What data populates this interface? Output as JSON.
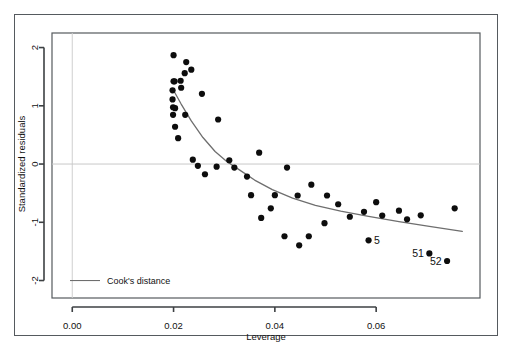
{
  "figure": {
    "kind": "r-base-plot",
    "background_color": "#ffffff",
    "frame_color": "#555a5e",
    "point_color": "#0d0d0d",
    "curve_color": "#6e6e6e",
    "zero_line_color": "#c8c8c8",
    "grid_line_color": "#cfcfcf"
  },
  "chart_data": {
    "type": "scatter",
    "title": "",
    "subtitle": "",
    "xlabel": "Leverage",
    "ylabel": "Standardized residuals",
    "xlim": [
      -0.004,
      0.0805
    ],
    "ylim": [
      -2.3,
      2.25
    ],
    "xticks": [
      0.0,
      0.02,
      0.04,
      0.06
    ],
    "xtick_labels": [
      "0.00",
      "0.02",
      "0.04",
      "0.06"
    ],
    "yticks": [
      2,
      1,
      0,
      -1,
      -2
    ],
    "ytick_labels": [
      "2",
      "1",
      "0",
      "-1",
      "-2"
    ],
    "grid": false,
    "zero_line": 0,
    "vertical_reference_line_x": 0.0,
    "legend": {
      "position": "bottom-left-inside",
      "entries": [
        {
          "label": "Cook's distance",
          "marker": "line",
          "color": "#6e6e6e"
        }
      ]
    },
    "series": [
      {
        "name": "observations",
        "marker": "filled-circle",
        "color": "#0d0d0d",
        "points": [
          {
            "x": 0.02,
            "y": 1.87
          },
          {
            "x": 0.0215,
            "y": 1.31
          },
          {
            "x": 0.02,
            "y": 1.42
          },
          {
            "x": 0.0202,
            "y": 1.42
          },
          {
            "x": 0.0198,
            "y": 1.265
          },
          {
            "x": 0.0198,
            "y": 1.11
          },
          {
            "x": 0.0199,
            "y": 0.975
          },
          {
            "x": 0.0203,
            "y": 0.96
          },
          {
            "x": 0.0199,
            "y": 0.845
          },
          {
            "x": 0.0203,
            "y": 0.64
          },
          {
            "x": 0.0209,
            "y": 0.445
          },
          {
            "x": 0.0214,
            "y": 1.43
          },
          {
            "x": 0.0222,
            "y": 1.56
          },
          {
            "x": 0.0225,
            "y": 1.75
          },
          {
            "x": 0.0235,
            "y": 1.62
          },
          {
            "x": 0.0223,
            "y": 0.845
          },
          {
            "x": 0.0238,
            "y": 0.075
          },
          {
            "x": 0.0248,
            "y": -0.03
          },
          {
            "x": 0.0262,
            "y": -0.175
          },
          {
            "x": 0.0256,
            "y": 1.205
          },
          {
            "x": 0.0288,
            "y": 0.765
          },
          {
            "x": 0.0285,
            "y": -0.045
          },
          {
            "x": 0.031,
            "y": 0.065
          },
          {
            "x": 0.032,
            "y": -0.06
          },
          {
            "x": 0.0345,
            "y": -0.215
          },
          {
            "x": 0.0353,
            "y": -0.535
          },
          {
            "x": 0.0369,
            "y": 0.195
          },
          {
            "x": 0.0373,
            "y": -0.925
          },
          {
            "x": 0.0392,
            "y": -0.76
          },
          {
            "x": 0.04,
            "y": -0.535
          },
          {
            "x": 0.0419,
            "y": -1.24
          },
          {
            "x": 0.0424,
            "y": -0.06
          },
          {
            "x": 0.0448,
            "y": -1.395
          },
          {
            "x": 0.0445,
            "y": -0.54
          },
          {
            "x": 0.0467,
            "y": -1.24
          },
          {
            "x": 0.0472,
            "y": -0.355
          },
          {
            "x": 0.0498,
            "y": -1.015
          },
          {
            "x": 0.0503,
            "y": -0.54
          },
          {
            "x": 0.0525,
            "y": -0.69
          },
          {
            "x": 0.0548,
            "y": -0.905
          },
          {
            "x": 0.0576,
            "y": -0.82
          },
          {
            "x": 0.0585,
            "y": -1.31
          },
          {
            "x": 0.06,
            "y": -0.655
          },
          {
            "x": 0.0612,
            "y": -0.885
          },
          {
            "x": 0.0645,
            "y": -0.8
          },
          {
            "x": 0.0661,
            "y": -0.95
          },
          {
            "x": 0.0688,
            "y": -0.88
          },
          {
            "x": 0.0705,
            "y": -1.535
          },
          {
            "x": 0.074,
            "y": -1.665
          },
          {
            "x": 0.0755,
            "y": -0.76
          }
        ]
      }
    ],
    "labeled_points": [
      {
        "label": "5",
        "x": 0.0585,
        "y": -1.31,
        "label_side": "right"
      },
      {
        "label": "51",
        "x": 0.0705,
        "y": -1.535,
        "label_side": "left"
      },
      {
        "label": "52",
        "x": 0.074,
        "y": -1.665,
        "label_side": "left"
      }
    ],
    "curves": [
      {
        "name": "Cook's distance",
        "color": "#6e6e6e",
        "points": [
          {
            "x": 0.0199,
            "y": 1.28
          },
          {
            "x": 0.0215,
            "y": 1.03
          },
          {
            "x": 0.0235,
            "y": 0.74
          },
          {
            "x": 0.0258,
            "y": 0.455
          },
          {
            "x": 0.0282,
            "y": 0.215
          },
          {
            "x": 0.0305,
            "y": 0.045
          },
          {
            "x": 0.033,
            "y": -0.1
          },
          {
            "x": 0.036,
            "y": -0.275
          },
          {
            "x": 0.0395,
            "y": -0.44
          },
          {
            "x": 0.0435,
            "y": -0.585
          },
          {
            "x": 0.048,
            "y": -0.71
          },
          {
            "x": 0.053,
            "y": -0.81
          },
          {
            "x": 0.0585,
            "y": -0.9
          },
          {
            "x": 0.0645,
            "y": -0.99
          },
          {
            "x": 0.0705,
            "y": -1.07
          },
          {
            "x": 0.077,
            "y": -1.155
          }
        ]
      }
    ]
  }
}
